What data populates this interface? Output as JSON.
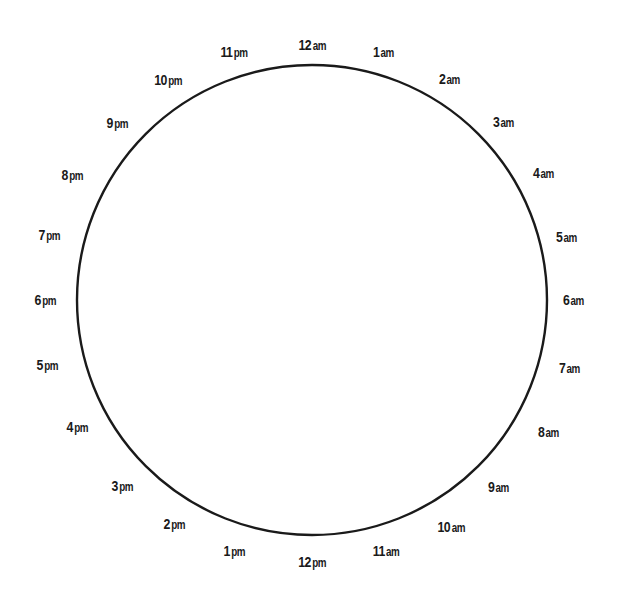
{
  "diagram": {
    "type": "24-hour clock dial",
    "center": [
      312,
      300
    ],
    "radius": 235,
    "spoke_count": 24,
    "colors": {
      "rim": "#1a1a1a",
      "spokes": "#9a9a9a",
      "label": "#1a1a1a",
      "background": "#ffffff"
    },
    "labels": [
      {
        "num": "12",
        "suffix": "am",
        "x": 312,
        "y": 45
      },
      {
        "num": "1",
        "suffix": "am",
        "x": 384,
        "y": 52
      },
      {
        "num": "2",
        "suffix": "am",
        "x": 450,
        "y": 79
      },
      {
        "num": "3",
        "suffix": "am",
        "x": 504,
        "y": 122
      },
      {
        "num": "4",
        "suffix": "am",
        "x": 544,
        "y": 173
      },
      {
        "num": "5",
        "suffix": "am",
        "x": 567,
        "y": 237
      },
      {
        "num": "6",
        "suffix": "am",
        "x": 574,
        "y": 300
      },
      {
        "num": "7",
        "suffix": "am",
        "x": 570,
        "y": 368
      },
      {
        "num": "8",
        "suffix": "am",
        "x": 549,
        "y": 432
      },
      {
        "num": "9",
        "suffix": "am",
        "x": 499,
        "y": 487
      },
      {
        "num": "10",
        "suffix": "am",
        "x": 451,
        "y": 527
      },
      {
        "num": "11",
        "suffix": "am",
        "x": 386,
        "y": 551
      },
      {
        "num": "12",
        "suffix": "pm",
        "x": 312,
        "y": 562
      },
      {
        "num": "1",
        "suffix": "pm",
        "x": 235,
        "y": 551
      },
      {
        "num": "2",
        "suffix": "pm",
        "x": 175,
        "y": 524
      },
      {
        "num": "3",
        "suffix": "pm",
        "x": 123,
        "y": 486
      },
      {
        "num": "4",
        "suffix": "pm",
        "x": 78,
        "y": 427
      },
      {
        "num": "5",
        "suffix": "pm",
        "x": 48,
        "y": 365
      },
      {
        "num": "6",
        "suffix": "pm",
        "x": 46,
        "y": 300
      },
      {
        "num": "7",
        "suffix": "pm",
        "x": 50,
        "y": 235
      },
      {
        "num": "8",
        "suffix": "pm",
        "x": 73,
        "y": 175
      },
      {
        "num": "9",
        "suffix": "pm",
        "x": 118,
        "y": 123
      },
      {
        "num": "10",
        "suffix": "pm",
        "x": 168,
        "y": 80
      },
      {
        "num": "11",
        "suffix": "pm",
        "x": 234,
        "y": 52
      }
    ]
  }
}
